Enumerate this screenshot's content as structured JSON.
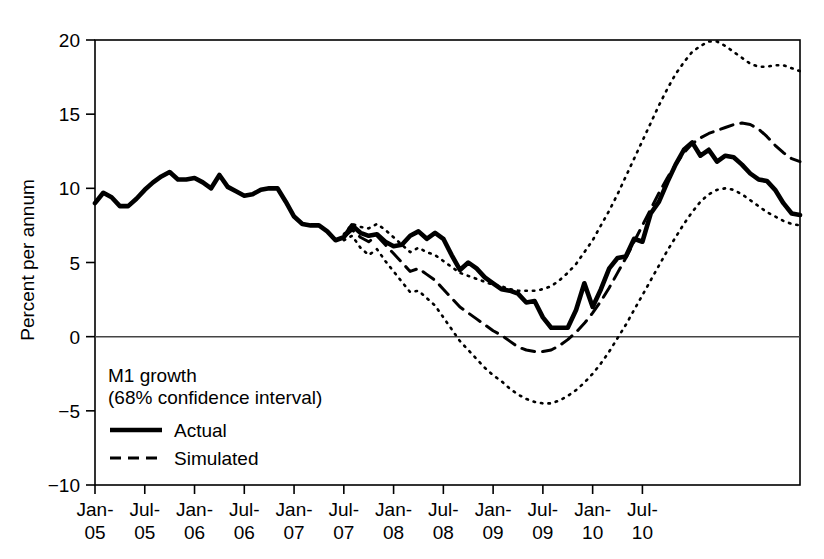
{
  "chart_data": {
    "type": "line",
    "title": "",
    "xlabel": "",
    "ylabel": "Percent per annum",
    "ylim": [
      -10,
      20
    ],
    "yticks": [
      -10,
      -5,
      0,
      5,
      10,
      15,
      20
    ],
    "ytick_labels": [
      "−10",
      "−5",
      "0",
      "5",
      "10",
      "15",
      "20"
    ],
    "grid": false,
    "legend_position": "lower-left-inside",
    "annotations": [
      "M1 growth",
      "(68% confidence interval)"
    ],
    "xtick_labels": [
      "Jan-\n05",
      "Jul-\n05",
      "Jan-\n06",
      "Jul-\n06",
      "Jan-\n07",
      "Jul-\n07",
      "Jan-\n08",
      "Jul-\n08",
      "Jan-\n09",
      "Jul-\n09",
      "Jan-\n10",
      "Jul-\n10"
    ],
    "xticks_top": [
      "Jan-",
      "Jul-",
      "Jan-",
      "Jul-",
      "Jan-",
      "Jul-",
      "Jan-",
      "Jul-",
      "Jan-",
      "Jul-",
      "Jan-",
      "Jul-"
    ],
    "xticks_bottom": [
      "05",
      "05",
      "06",
      "06",
      "07",
      "07",
      "08",
      "08",
      "09",
      "09",
      "10",
      "10"
    ],
    "x_start": "Jan-05",
    "x_end": "Jul-10",
    "x_period_months": 1,
    "forecast_start_index": 30,
    "legend": [
      {
        "name": "Actual",
        "style": "solid",
        "width": 4,
        "color": "#000000"
      },
      {
        "name": "Simulated",
        "style": "dashed",
        "width": 3,
        "color": "#000000"
      }
    ],
    "series": [
      {
        "name": "Actual",
        "style": "solid",
        "color": "#000000",
        "values": [
          9.0,
          9.7,
          9.4,
          8.8,
          8.8,
          9.3,
          9.9,
          10.4,
          10.8,
          11.1,
          10.6,
          10.6,
          10.7,
          10.4,
          10.0,
          10.9,
          10.1,
          9.8,
          9.5,
          9.6,
          9.9,
          10.0,
          10.0,
          9.1,
          8.1,
          7.6,
          7.5,
          7.5,
          7.1,
          6.5,
          6.7,
          7.5,
          7.0,
          6.8,
          6.9,
          6.4,
          6.1,
          6.2,
          6.8,
          7.1,
          6.6,
          7.0,
          6.6,
          5.5,
          4.5,
          5.0,
          4.6,
          4.0,
          3.6,
          3.2,
          3.1,
          2.9,
          2.3,
          2.4,
          1.3,
          0.6,
          0.6,
          0.6,
          1.8,
          3.6,
          2.0,
          3.2,
          4.6,
          5.3,
          5.4,
          6.6,
          6.4,
          8.3,
          9.1,
          10.4,
          11.6,
          12.6,
          13.1,
          12.2,
          12.6,
          11.8,
          12.2,
          12.1,
          11.6,
          11.0,
          10.6,
          10.5,
          9.9,
          9.0,
          8.3,
          8.2
        ]
      },
      {
        "name": "Simulated",
        "style": "dashed",
        "color": "#000000",
        "values": [
          null,
          null,
          null,
          null,
          null,
          null,
          null,
          null,
          null,
          null,
          null,
          null,
          null,
          null,
          null,
          null,
          null,
          null,
          null,
          null,
          null,
          null,
          null,
          null,
          null,
          null,
          null,
          null,
          null,
          null,
          6.7,
          7.2,
          6.7,
          6.4,
          6.8,
          6.2,
          5.6,
          5.0,
          4.4,
          4.6,
          4.2,
          3.8,
          3.2,
          2.6,
          2.0,
          1.6,
          1.2,
          0.8,
          0.4,
          0.1,
          -0.3,
          -0.7,
          -0.9,
          -1.0,
          -1.0,
          -0.9,
          -0.6,
          -0.2,
          0.3,
          0.9,
          1.6,
          2.4,
          3.3,
          4.3,
          5.3,
          6.4,
          7.5,
          8.6,
          9.7,
          10.7,
          11.6,
          12.4,
          13.0,
          13.4,
          13.7,
          13.9,
          14.1,
          14.3,
          14.4,
          14.3,
          14.0,
          13.5,
          12.9,
          12.4,
          12.0,
          11.8
        ]
      },
      {
        "name": "Upper 68% confidence bound",
        "style": "dotted",
        "color": "#000000",
        "values": [
          null,
          null,
          null,
          null,
          null,
          null,
          null,
          null,
          null,
          null,
          null,
          null,
          null,
          null,
          null,
          null,
          null,
          null,
          null,
          null,
          null,
          null,
          null,
          null,
          null,
          null,
          null,
          null,
          null,
          null,
          6.9,
          7.6,
          7.4,
          7.3,
          7.6,
          7.2,
          6.7,
          6.2,
          5.7,
          6.0,
          5.7,
          5.5,
          5.1,
          4.7,
          4.3,
          4.1,
          3.9,
          3.7,
          3.5,
          3.4,
          3.2,
          3.1,
          3.1,
          3.1,
          3.2,
          3.4,
          3.8,
          4.3,
          4.9,
          5.7,
          6.5,
          7.5,
          8.5,
          9.6,
          10.8,
          12.0,
          13.2,
          14.4,
          15.6,
          16.7,
          17.7,
          18.5,
          19.2,
          19.6,
          19.9,
          19.9,
          19.6,
          19.2,
          18.8,
          18.4,
          18.2,
          18.2,
          18.3,
          18.3,
          18.1,
          17.9
        ]
      },
      {
        "name": "Lower 68% confidence bound",
        "style": "dotted",
        "color": "#000000",
        "values": [
          null,
          null,
          null,
          null,
          null,
          null,
          null,
          null,
          null,
          null,
          null,
          null,
          null,
          null,
          null,
          null,
          null,
          null,
          null,
          null,
          null,
          null,
          null,
          null,
          null,
          null,
          null,
          null,
          null,
          null,
          6.5,
          6.8,
          6.0,
          5.5,
          5.9,
          5.1,
          4.4,
          3.7,
          3.0,
          3.1,
          2.6,
          2.1,
          1.3,
          0.5,
          -0.3,
          -0.9,
          -1.5,
          -2.1,
          -2.6,
          -3.0,
          -3.5,
          -3.9,
          -4.2,
          -4.4,
          -4.5,
          -4.5,
          -4.3,
          -4.0,
          -3.6,
          -3.1,
          -2.5,
          -1.8,
          -1.0,
          -0.1,
          0.8,
          1.8,
          2.8,
          3.8,
          4.8,
          5.8,
          6.7,
          7.6,
          8.4,
          9.1,
          9.6,
          9.9,
          10.0,
          9.9,
          9.6,
          9.2,
          8.8,
          8.4,
          8.1,
          7.8,
          7.6,
          7.5
        ]
      }
    ]
  },
  "axes": {
    "zero_line": 0
  }
}
